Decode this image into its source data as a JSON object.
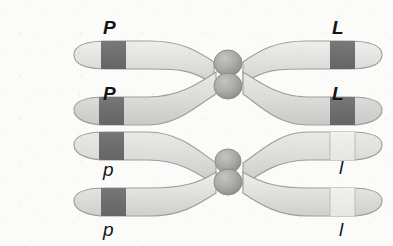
{
  "figure": {
    "background_color": "#fbfbfa"
  },
  "palette": {
    "chromatid_fill": "#dcdcda",
    "chromatid_fill_light": "#e9e9e7",
    "chromatid_outline": "#9a9a98",
    "band_dark": "#6f6f6f",
    "band_light": "#ececea",
    "centromere_fill": "#a9a9a7",
    "centromere_outline": "#8a8a88",
    "label_color": "#151515"
  },
  "labels": {
    "left": [
      {
        "id": "left-P-upper",
        "text": "P",
        "allele": "dominant",
        "x": 103,
        "y": 18
      },
      {
        "id": "left-P-lower",
        "text": "P",
        "allele": "dominant",
        "x": 103,
        "y": 84
      },
      {
        "id": "left-p-upper",
        "text": "p",
        "allele": "recessive",
        "x": 103,
        "y": 160
      },
      {
        "id": "left-p-lower",
        "text": "p",
        "allele": "recessive",
        "x": 103,
        "y": 220
      }
    ],
    "right": [
      {
        "id": "right-L-upper",
        "text": "L",
        "allele": "dominant",
        "x": 332,
        "y": 18
      },
      {
        "id": "right-L-lower",
        "text": "L",
        "allele": "dominant",
        "x": 332,
        "y": 84
      },
      {
        "id": "right-l-upper",
        "text": "l",
        "allele": "recessive",
        "x": 339,
        "y": 158
      },
      {
        "id": "right-l-lower",
        "text": "l",
        "allele": "recessive",
        "x": 339,
        "y": 220
      }
    ]
  },
  "chromatids": [
    {
      "id": "chromatid-1",
      "name": "chromatid-P-L-top",
      "left_allele": "P",
      "right_allele": "L",
      "left_band": "dark",
      "right_band": "dark"
    },
    {
      "id": "chromatid-2",
      "name": "chromatid-P-L-second",
      "left_allele": "P",
      "right_allele": "L",
      "left_band": "dark",
      "right_band": "dark"
    },
    {
      "id": "chromatid-3",
      "name": "chromatid-p-l-third",
      "left_allele": "p",
      "right_allele": "l",
      "left_band": "dark",
      "right_band": "light"
    },
    {
      "id": "chromatid-4",
      "name": "chromatid-p-l-bottom",
      "left_allele": "p",
      "right_allele": "l",
      "left_band": "dark",
      "right_band": "light"
    }
  ],
  "centromeres": [
    {
      "id": "centromere-top-upper",
      "cx": 228,
      "cy": 63,
      "r": 13
    },
    {
      "id": "centromere-top-lower",
      "cx": 228,
      "cy": 86,
      "r": 13
    },
    {
      "id": "centromere-bottom-upper",
      "cx": 228,
      "cy": 161,
      "r": 12
    },
    {
      "id": "centromere-bottom-lower",
      "cx": 228,
      "cy": 182,
      "r": 13
    }
  ]
}
